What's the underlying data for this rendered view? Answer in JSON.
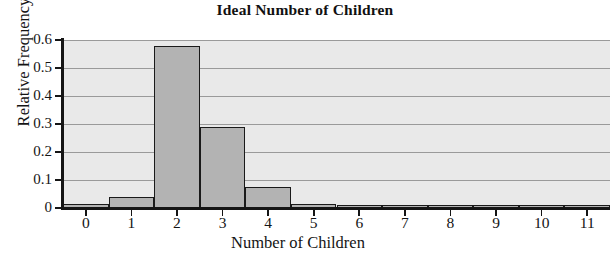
{
  "figure": {
    "part_label": ")",
    "title": "Ideal Number of Children"
  },
  "chart_data": {
    "type": "bar",
    "title": "Ideal Number of Children",
    "xlabel": "Number of Children",
    "ylabel": "Relative Frequency",
    "categories": [
      "0",
      "1",
      "2",
      "3",
      "4",
      "5",
      "6",
      "7",
      "8",
      "9",
      "10",
      "11"
    ],
    "values": [
      0.015,
      0.04,
      0.578,
      0.29,
      0.076,
      0.013,
      0.004,
      0.002,
      0.003,
      0.001,
      0.005,
      0.001
    ],
    "xlim": [
      -0.5,
      11.5
    ],
    "ylim": [
      0,
      0.6
    ],
    "ytick_labels": [
      "0",
      "0.1",
      "0.2",
      "0.3",
      "0.4",
      "0.5",
      "0.6"
    ],
    "ytick_values": [
      0,
      0.1,
      0.2,
      0.3,
      0.4,
      0.5,
      0.6
    ],
    "xtick_labels": [
      "0",
      "1",
      "2",
      "3",
      "4",
      "5",
      "6",
      "7",
      "8",
      "9",
      "10",
      "11"
    ],
    "grid": true,
    "legend": null,
    "bar_fill_color": "#b3b3b3",
    "bar_edge_color": "#1a1a1a",
    "plot_background_color": "#e9e9e9",
    "gridline_color": "#9a9a9a"
  }
}
